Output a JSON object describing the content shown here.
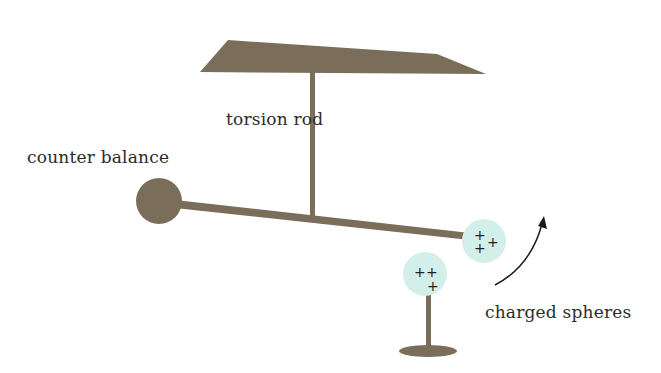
{
  "diagram": {
    "labels": {
      "torsion_rod": "torsion rod",
      "counter_balance": "counter balance",
      "charged_spheres": "charged spheres"
    },
    "sphere_charges": {
      "suspended": [
        "+",
        "+",
        "+"
      ],
      "fixed": [
        "+",
        "+",
        "+"
      ]
    },
    "colors": {
      "rod": "#7a6e5a",
      "sphere_fill": "#d3efe9",
      "text": "#2b2b2b",
      "arrow": "#1a1a1a"
    }
  }
}
